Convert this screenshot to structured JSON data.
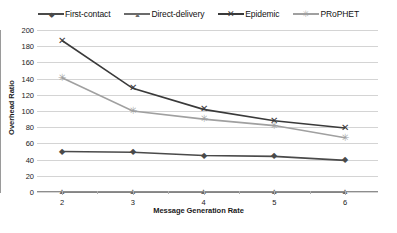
{
  "chart_data": {
    "type": "line",
    "title": "",
    "xlabel": "Message Generation Rate",
    "ylabel": "Overhead Ratio",
    "x": [
      2,
      3,
      4,
      5,
      6
    ],
    "xticklabels": [
      "2",
      "3",
      "4",
      "5",
      "6"
    ],
    "yticks": [
      0,
      20,
      40,
      60,
      80,
      100,
      120,
      140,
      160,
      180,
      200
    ],
    "yticklabels": [
      "0",
      "20",
      "40",
      "60",
      "80",
      "100",
      "120",
      "140",
      "160",
      "180",
      "200"
    ],
    "ylim": [
      0,
      200
    ],
    "grid": "horizontal",
    "legend_position": "top-center",
    "series": [
      {
        "name": "First-contact",
        "values": [
          50,
          49,
          45,
          44,
          39
        ],
        "color": "#4a4a4a",
        "marker": "diamond",
        "marker_glyph": "◆"
      },
      {
        "name": "Direct-delivery",
        "values": [
          0,
          0,
          0,
          0,
          0
        ],
        "color": "#6b6b6b",
        "marker": "triangle",
        "marker_glyph": "▲"
      },
      {
        "name": "Epidemic",
        "values": [
          187,
          128,
          102,
          88,
          79
        ],
        "color": "#3a3a3a",
        "marker": "cross",
        "marker_glyph": "✕"
      },
      {
        "name": "PRoPHET",
        "values": [
          141,
          100,
          90,
          82,
          67
        ],
        "color": "#a0a0a0",
        "marker": "asterisk",
        "marker_glyph": "✳"
      }
    ]
  }
}
